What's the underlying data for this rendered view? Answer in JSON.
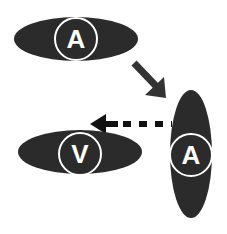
{
  "diagram": {
    "colors": {
      "shape_fill": "#2b2b2b",
      "ring": "#ffffff",
      "arrow": "#333333",
      "background": "#ffffff"
    },
    "nodes": [
      {
        "id": "top",
        "label": "A",
        "orientation": "horizontal"
      },
      {
        "id": "right",
        "label": "A",
        "orientation": "vertical"
      },
      {
        "id": "bottom-left",
        "label": "V",
        "orientation": "horizontal"
      }
    ],
    "edges": [
      {
        "from": "top",
        "to": "right",
        "style": "solid"
      },
      {
        "from": "right",
        "to": "bottom-left",
        "style": "dashed"
      }
    ]
  }
}
